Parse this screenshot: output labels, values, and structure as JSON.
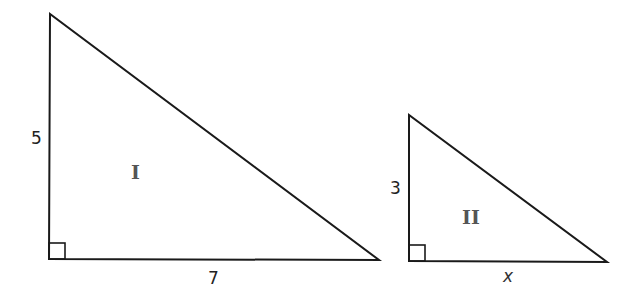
{
  "diagram": {
    "triangle_1": {
      "label": "I",
      "vertical_leg": "5",
      "horizontal_leg": "7",
      "right_angle": true
    },
    "triangle_2": {
      "label": "II",
      "vertical_leg": "3",
      "horizontal_leg": "x",
      "right_angle": true
    },
    "stroke_color": "#1a1a1a"
  }
}
